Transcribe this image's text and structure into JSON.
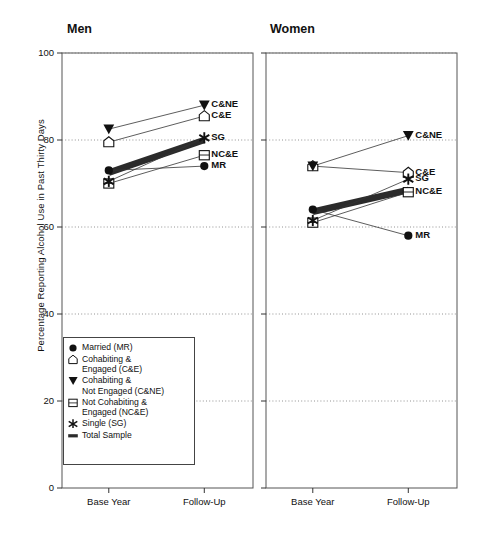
{
  "figure": {
    "ylabel": "Percentage Reporting Alcohol Use in Past Thirty Days",
    "panels": [
      {
        "title": "Men"
      },
      {
        "title": "Women"
      }
    ]
  },
  "legend": {
    "items": [
      {
        "symbol": "filled-circle",
        "label": "Married (MR)"
      },
      {
        "symbol": "open-pentagon",
        "label": "Cohabiting &\nEngaged (C&E)"
      },
      {
        "symbol": "filled-triangle-down",
        "label": "Cohabiting &\nNot Engaged (C&NE)"
      },
      {
        "symbol": "open-square",
        "label": "Not Cohabiting &\nEngaged (NC&E)"
      },
      {
        "symbol": "asterisk-star",
        "label": "Single (SG)"
      },
      {
        "symbol": "thick-bar",
        "label": "Total Sample"
      }
    ]
  },
  "chart_data": {
    "type": "line",
    "title": "",
    "xlabel": "",
    "ylabel": "Percentage Reporting Alcohol Use in Past Thirty Days",
    "ylim": [
      0,
      100
    ],
    "yticks": [
      0,
      20,
      40,
      60,
      80,
      100
    ],
    "x": [
      "Base Year",
      "Follow-Up"
    ],
    "grid": "horizontal-dotted",
    "legend_position": "inside-lower-left",
    "panels": [
      {
        "name": "Men",
        "series": [
          {
            "name": "Married (MR)",
            "abbr": "MR",
            "symbol": "filled-circle",
            "values": [
              73.0,
              74.0
            ]
          },
          {
            "name": "Cohabiting & Engaged (C&E)",
            "abbr": "C&E",
            "symbol": "open-pentagon",
            "values": [
              79.5,
              85.5
            ]
          },
          {
            "name": "Cohabiting & Not Engaged (C&NE)",
            "abbr": "C&NE",
            "symbol": "filled-triangle-down",
            "values": [
              82.5,
              88.0
            ]
          },
          {
            "name": "Not Cohabiting & Engaged (NC&E)",
            "abbr": "NC&E",
            "symbol": "open-square",
            "values": [
              70.0,
              76.5
            ]
          },
          {
            "name": "Single (SG)",
            "abbr": "SG",
            "symbol": "asterisk-star",
            "values": [
              70.5,
              80.5
            ]
          },
          {
            "name": "Total Sample",
            "abbr": "",
            "symbol": "thick-bar",
            "values": [
              72.5,
              80.0
            ]
          }
        ]
      },
      {
        "name": "Women",
        "series": [
          {
            "name": "Married (MR)",
            "abbr": "MR",
            "symbol": "filled-circle",
            "values": [
              64.0,
              58.0
            ]
          },
          {
            "name": "Cohabiting & Engaged (C&E)",
            "abbr": "C&E",
            "symbol": "open-pentagon",
            "values": [
              74.0,
              72.5
            ]
          },
          {
            "name": "Cohabiting & Not Engaged (C&NE)",
            "abbr": "C&NE",
            "symbol": "filled-triangle-down",
            "values": [
              74.0,
              81.0
            ]
          },
          {
            "name": "Not Cohabiting & Engaged (NC&E)",
            "abbr": "NC&E",
            "symbol": "open-square",
            "values": [
              61.0,
              68.0
            ]
          },
          {
            "name": "Single (SG)",
            "abbr": "SG",
            "symbol": "asterisk-star",
            "values": [
              61.5,
              71.0
            ]
          },
          {
            "name": "Total Sample",
            "abbr": "",
            "symbol": "thick-bar",
            "values": [
              63.5,
              68.5
            ]
          }
        ]
      }
    ]
  }
}
